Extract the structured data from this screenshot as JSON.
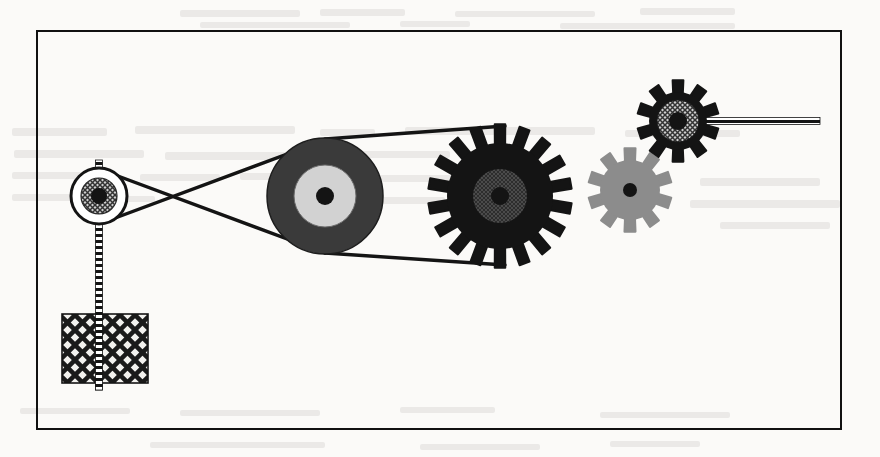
{
  "page": {
    "width": 880,
    "height": 457,
    "background_color": "#fbfaf8",
    "scan_artifacts": "faint bleed-through text ghosting from reverse side of page"
  },
  "frame": {
    "name": "figure-border",
    "x": 36,
    "y": 30,
    "width": 806,
    "height": 400,
    "stroke_color": "#111111",
    "stroke_width": 2.5
  },
  "palette": {
    "black": "#141414",
    "dark_gray": "#3a3a3a",
    "mid_gray": "#8c8c8c",
    "light_gray": "#d2d2d2",
    "white": "#ffffff",
    "paper": "#fbfaf8",
    "ink": "#111111"
  },
  "components": {
    "small_pulley": {
      "label": "small-pulley",
      "cx": 99,
      "cy": 196,
      "outer_radius": 28,
      "hub_radius": 18,
      "center_radius": 8,
      "rim_fill": "#ffffff",
      "hub_fill": "crosshatch-gray",
      "center_fill": "#141414"
    },
    "large_pulley": {
      "label": "large-pulley",
      "cx": 325,
      "cy": 196,
      "outer_radius": 58,
      "inner_ring_radius": 31,
      "center_radius": 9,
      "outer_fill": "#3a3a3a",
      "inner_fill": "#d2d2d2",
      "center_fill": "#141414"
    },
    "large_gear": {
      "label": "large-gear",
      "cx": 500,
      "cy": 196,
      "root_radius": 53,
      "tip_radius": 72,
      "teeth": 18,
      "hub_radius": 27,
      "center_radius": 9,
      "body_fill": "#141414",
      "hub_fill": "#2f2f2f",
      "center_fill": "#141414"
    },
    "gray_gear": {
      "label": "gray-idler-gear",
      "cx": 630,
      "cy": 190,
      "root_radius": 30,
      "tip_radius": 42,
      "teeth": 10,
      "center_radius": 7,
      "body_fill": "#8c8c8c",
      "center_fill": "#141414"
    },
    "top_gear": {
      "label": "top-output-gear",
      "cx": 678,
      "cy": 121,
      "root_radius": 29,
      "tip_radius": 41,
      "teeth": 10,
      "hub_radius": 21,
      "center_radius": 9,
      "body_fill": "#141414",
      "hub_fill": "crosshatch-gray",
      "center_fill": "#141414"
    },
    "weight_block": {
      "label": "hanging-weight",
      "x": 62,
      "y": 314,
      "width": 86,
      "height": 69,
      "fill": "diagonal-lattice-hatch",
      "stroke_color": "#141414"
    },
    "vertical_rod": {
      "label": "vertical-hatched-rod",
      "x": 99,
      "y_top": 160,
      "y_bottom": 390,
      "style": "hatched-tick-line"
    },
    "output_shaft": {
      "label": "horizontal-output-shaft",
      "y": 121,
      "x_start": 678,
      "x_end": 820,
      "style": "hatched-tick-line"
    }
  },
  "belts": [
    {
      "name": "crossed-belt",
      "from": "small-pulley",
      "to": "large-pulley",
      "configuration": "crossed",
      "crossing_x": 215,
      "crossing_y": 196,
      "stroke_width": 3.4,
      "color": "#141414"
    },
    {
      "name": "open-belt",
      "from": "large-pulley",
      "to": "large-gear",
      "configuration": "open",
      "stroke_width": 3.4,
      "color": "#141414"
    }
  ],
  "gear_mesh": [
    {
      "name": "mesh-large-to-gray",
      "pair": [
        "large-gear",
        "gray-idler-gear"
      ]
    },
    {
      "name": "mesh-gray-to-top",
      "pair": [
        "gray-idler-gear",
        "top-output-gear"
      ]
    }
  ],
  "ghost_text_blocks": [
    {
      "x": 180,
      "y": 10,
      "width": 120,
      "height": 7
    },
    {
      "x": 320,
      "y": 9,
      "width": 85,
      "height": 7
    },
    {
      "x": 455,
      "y": 11,
      "width": 140,
      "height": 6
    },
    {
      "x": 640,
      "y": 8,
      "width": 95,
      "height": 7
    },
    {
      "x": 200,
      "y": 22,
      "width": 150,
      "height": 6
    },
    {
      "x": 400,
      "y": 21,
      "width": 70,
      "height": 6
    },
    {
      "x": 560,
      "y": 23,
      "width": 175,
      "height": 6
    },
    {
      "x": 12,
      "y": 128,
      "width": 95,
      "height": 8
    },
    {
      "x": 135,
      "y": 126,
      "width": 160,
      "height": 8
    },
    {
      "x": 320,
      "y": 129,
      "width": 55,
      "height": 7
    },
    {
      "x": 405,
      "y": 127,
      "width": 190,
      "height": 8
    },
    {
      "x": 625,
      "y": 130,
      "width": 115,
      "height": 7
    },
    {
      "x": 14,
      "y": 150,
      "width": 130,
      "height": 8
    },
    {
      "x": 165,
      "y": 152,
      "width": 175,
      "height": 8
    },
    {
      "x": 360,
      "y": 151,
      "width": 90,
      "height": 7
    },
    {
      "x": 470,
      "y": 153,
      "width": 60,
      "height": 7
    },
    {
      "x": 12,
      "y": 172,
      "width": 105,
      "height": 7
    },
    {
      "x": 140,
      "y": 174,
      "width": 80,
      "height": 7
    },
    {
      "x": 240,
      "y": 173,
      "width": 60,
      "height": 7
    },
    {
      "x": 370,
      "y": 175,
      "width": 120,
      "height": 7
    },
    {
      "x": 12,
      "y": 194,
      "width": 70,
      "height": 7
    },
    {
      "x": 100,
      "y": 196,
      "width": 55,
      "height": 6
    },
    {
      "x": 360,
      "y": 197,
      "width": 85,
      "height": 7
    },
    {
      "x": 700,
      "y": 178,
      "width": 120,
      "height": 8
    },
    {
      "x": 690,
      "y": 200,
      "width": 150,
      "height": 8
    },
    {
      "x": 720,
      "y": 222,
      "width": 110,
      "height": 7
    },
    {
      "x": 20,
      "y": 408,
      "width": 110,
      "height": 6
    },
    {
      "x": 180,
      "y": 410,
      "width": 140,
      "height": 6
    },
    {
      "x": 400,
      "y": 407,
      "width": 95,
      "height": 6
    },
    {
      "x": 600,
      "y": 412,
      "width": 130,
      "height": 6
    },
    {
      "x": 150,
      "y": 442,
      "width": 175,
      "height": 6
    },
    {
      "x": 420,
      "y": 444,
      "width": 120,
      "height": 6
    },
    {
      "x": 610,
      "y": 441,
      "width": 90,
      "height": 6
    }
  ]
}
